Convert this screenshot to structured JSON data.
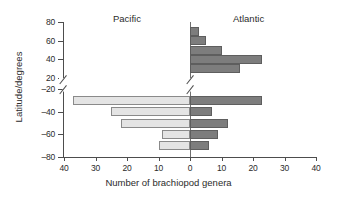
{
  "chart_data": {
    "type": "bar",
    "orientation": "horizontal",
    "title": "",
    "xlabel": "Number of brachiopod genera",
    "ylabel": "Latitude/degrees",
    "grid": false,
    "legend_position": "none",
    "panel_labels": {
      "left": "Pacific",
      "right": "Atlantic"
    },
    "xlim": [
      -40,
      40
    ],
    "x_tick_values": [
      -40,
      -30,
      -20,
      -10,
      0,
      10,
      20,
      30,
      40
    ],
    "x_tick_labels": [
      "40",
      "30",
      "20",
      "10",
      "0",
      "10",
      "20",
      "30",
      "40"
    ],
    "y_tick_labels": [
      "80",
      "60",
      "40",
      "20",
      "–20",
      "–40",
      "–60",
      "–80"
    ],
    "y_axis_break": "between 20 and –20",
    "categories": [
      70,
      60,
      50,
      40,
      30,
      -30,
      -40,
      -50,
      -60,
      -70
    ],
    "category_labels": [
      "70",
      "60",
      "50",
      "40",
      "30",
      "–30",
      "–40",
      "–50",
      "–60",
      "–70"
    ],
    "series": [
      {
        "name": "Pacific",
        "side": "left",
        "color": "#e4e4e4",
        "values": [
          0,
          0,
          0,
          0,
          0,
          37,
          25,
          22,
          9,
          10
        ]
      },
      {
        "name": "Atlantic",
        "side": "right",
        "color": "#7d7d7d",
        "values": [
          3,
          5,
          10,
          23,
          16,
          23,
          7,
          12,
          9,
          6
        ]
      }
    ]
  },
  "bars": [
    {
      "name": "pacific-70N",
      "side": "left",
      "value": 0,
      "lat": 70
    },
    {
      "name": "pacific-60N",
      "side": "left",
      "value": 0,
      "lat": 60
    },
    {
      "name": "pacific-50N",
      "side": "left",
      "value": 0,
      "lat": 50
    },
    {
      "name": "pacific-40N",
      "side": "left",
      "value": 0,
      "lat": 40
    },
    {
      "name": "pacific-30N",
      "side": "left",
      "value": 0,
      "lat": 30
    },
    {
      "name": "pacific-30S",
      "side": "left",
      "value": 37,
      "lat": -30
    },
    {
      "name": "pacific-40S",
      "side": "left",
      "value": 25,
      "lat": -40
    },
    {
      "name": "pacific-50S",
      "side": "left",
      "value": 22,
      "lat": -50
    },
    {
      "name": "pacific-60S",
      "side": "left",
      "value": 9,
      "lat": -60
    },
    {
      "name": "pacific-70S",
      "side": "left",
      "value": 10,
      "lat": -70
    },
    {
      "name": "atlantic-70N",
      "side": "right",
      "value": 3,
      "lat": 70
    },
    {
      "name": "atlantic-60N",
      "side": "right",
      "value": 5,
      "lat": 60
    },
    {
      "name": "atlantic-50N",
      "side": "right",
      "value": 10,
      "lat": 50
    },
    {
      "name": "atlantic-40N",
      "side": "right",
      "value": 23,
      "lat": 40
    },
    {
      "name": "atlantic-30N",
      "side": "right",
      "value": 16,
      "lat": 30
    },
    {
      "name": "atlantic-30S",
      "side": "right",
      "value": 23,
      "lat": -30
    },
    {
      "name": "atlantic-40S",
      "side": "right",
      "value": 7,
      "lat": -40
    },
    {
      "name": "atlantic-50S",
      "side": "right",
      "value": 12,
      "lat": -50
    },
    {
      "name": "atlantic-60S",
      "side": "right",
      "value": 9,
      "lat": -60
    },
    {
      "name": "atlantic-70S",
      "side": "right",
      "value": 6,
      "lat": -70
    }
  ],
  "colors": {
    "pacific_fill": "#e4e4e4",
    "pacific_edge": "#8a8a8a",
    "atlantic_fill": "#7d7d7d",
    "atlantic_edge": "#5e5e5e",
    "axis": "#4d4d4d",
    "text": "#2b2b2b",
    "background": "#ffffff"
  }
}
